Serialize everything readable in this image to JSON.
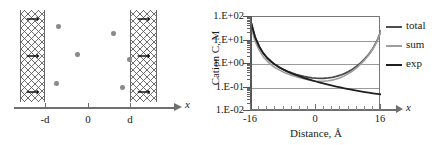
{
  "figure": {
    "panels": [
      "schematic",
      "concentration-profile"
    ]
  },
  "schematic": {
    "axis_label": "x",
    "tick_labels": [
      "-d",
      "0",
      "d"
    ],
    "tick_positions_px": [
      45,
      88,
      130
    ],
    "slabs": [
      {
        "name": "left-membrane-slab",
        "x": 20,
        "width": 25,
        "pattern": "cross-hatch"
      },
      {
        "name": "right-membrane-slab",
        "x": 130,
        "width": 27,
        "pattern": "cross-hatch"
      }
    ],
    "slab_arrow_count_per_slab": 3,
    "ions": [
      {
        "x": 56,
        "y": 24
      },
      {
        "x": 75,
        "y": 52
      },
      {
        "x": 54,
        "y": 81
      },
      {
        "x": 111,
        "y": 31
      },
      {
        "x": 127,
        "y": 57
      },
      {
        "x": 120,
        "y": 85
      }
    ]
  },
  "chart_data": {
    "type": "line",
    "title": "",
    "xlabel": "Distance, Å",
    "ylabel": "Cation C, M",
    "xlim": [
      -16,
      16
    ],
    "xticks": [
      -16,
      0,
      16
    ],
    "xtick_labels": [
      "-16",
      "0",
      "16"
    ],
    "yscale": "log",
    "ylim": [
      0.01,
      100
    ],
    "yticks": [
      100,
      10,
      1,
      0.1,
      0.01
    ],
    "ytick_labels": [
      "1.E+02",
      "1.E+01",
      "1.E+00",
      "1.E-01",
      "1.E-02"
    ],
    "grid": true,
    "legend_position": "right",
    "x": [
      -16,
      -15,
      -14,
      -13,
      -12,
      -11,
      -10,
      -9,
      -8,
      -7,
      -6,
      -5,
      -4,
      -3,
      -2,
      -1,
      0,
      1,
      2,
      3,
      4,
      5,
      6,
      7,
      8,
      9,
      10,
      11,
      12,
      13,
      14,
      15,
      16
    ],
    "series": [
      {
        "name": "total",
        "color": "#4d4d4d",
        "values": [
          60,
          14.0,
          5.6,
          2.9,
          1.8,
          1.25,
          0.92,
          0.72,
          0.58,
          0.49,
          0.42,
          0.365,
          0.325,
          0.295,
          0.273,
          0.258,
          0.249,
          0.245,
          0.247,
          0.255,
          0.27,
          0.295,
          0.333,
          0.39,
          0.475,
          0.6,
          0.8,
          1.12,
          1.65,
          2.6,
          4.6,
          9.5,
          26.0
        ]
      },
      {
        "name": "sum",
        "color": "#9d9d9d",
        "values": [
          40,
          9.5,
          3.9,
          2.05,
          1.3,
          0.92,
          0.69,
          0.55,
          0.45,
          0.385,
          0.333,
          0.292,
          0.259,
          0.234,
          0.215,
          0.2,
          0.19,
          0.185,
          0.186,
          0.193,
          0.206,
          0.228,
          0.262,
          0.312,
          0.39,
          0.505,
          0.69,
          0.99,
          1.5,
          2.42,
          4.35,
          9.1,
          25.0
        ]
      },
      {
        "name": "exp",
        "color": "#1f1f1f",
        "values": [
          60,
          14.0,
          5.6,
          2.9,
          1.8,
          1.25,
          0.92,
          0.715,
          0.575,
          0.475,
          0.4,
          0.342,
          0.296,
          0.259,
          0.228,
          0.202,
          0.18,
          0.162,
          0.146,
          0.132,
          0.12,
          0.11,
          0.1005,
          0.0925,
          0.0855,
          0.079,
          0.0735,
          0.0685,
          0.064,
          0.06,
          0.0565,
          0.0533,
          0.0505
        ]
      }
    ],
    "legend": [
      {
        "label": "total",
        "color": "#4d4d4d"
      },
      {
        "label": "sum",
        "color": "#9d9d9d"
      },
      {
        "label": "exp",
        "color": "#1f1f1f"
      }
    ],
    "xaxis_arrow_label": "x"
  },
  "colors": {
    "ion": "#8a8a8a",
    "frame": "#777777",
    "gridline": "#9a9a9a",
    "axis": "#6f6f6f"
  }
}
